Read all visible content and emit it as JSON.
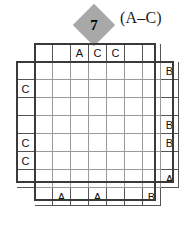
{
  "puzzle": {
    "number": "7",
    "letter_range": "(A–C)",
    "type": "easy-as-abc",
    "grid_size": 7,
    "colors": {
      "diamond_fill": "#a8a8a8",
      "frame": "#3a3a3a",
      "inner_gridline": "#9a9a9a",
      "clue_gridline": "#555555",
      "text": "#111111",
      "background": "#ffffff"
    },
    "clues": {
      "top": [
        "",
        "",
        "A",
        "C",
        "C",
        "",
        ""
      ],
      "bottom": [
        "",
        "A",
        "",
        "A",
        "",
        "",
        "B"
      ],
      "left": [
        "",
        "C",
        "",
        "",
        "C",
        "C",
        ""
      ],
      "right": [
        "B",
        "",
        "",
        "B",
        "B",
        "",
        "A"
      ]
    },
    "grid": [
      [
        "",
        "",
        "",
        "",
        "",
        "",
        ""
      ],
      [
        "",
        "",
        "",
        "",
        "",
        "",
        ""
      ],
      [
        "",
        "",
        "",
        "",
        "",
        "",
        ""
      ],
      [
        "",
        "",
        "",
        "",
        "",
        "",
        ""
      ],
      [
        "",
        "",
        "",
        "",
        "",
        "",
        ""
      ],
      [
        "",
        "",
        "",
        "",
        "",
        "",
        ""
      ],
      [
        "",
        "",
        "",
        "",
        "",
        "",
        ""
      ]
    ]
  }
}
